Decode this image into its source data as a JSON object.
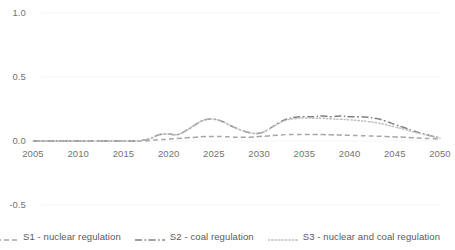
{
  "chart_data": {
    "type": "line",
    "title": "",
    "xlabel": "",
    "ylabel": "",
    "xlim": [
      2005,
      2050
    ],
    "ylim": [
      -0.5,
      1.0
    ],
    "ytick_labels": [
      "1.0",
      "0.5",
      "0.0",
      "-0.5"
    ],
    "ytick_values": [
      1.0,
      0.5,
      0.0,
      -0.5
    ],
    "xtick_labels": [
      "2005",
      "2010",
      "2015",
      "2020",
      "2025",
      "2030",
      "2035",
      "2040",
      "2045",
      "2050"
    ],
    "xtick_values": [
      2005,
      2010,
      2015,
      2020,
      2025,
      2030,
      2035,
      2040,
      2045,
      2050
    ],
    "grid": false,
    "legend_position": "bottom",
    "x": [
      2005,
      2006,
      2007,
      2008,
      2009,
      2010,
      2011,
      2012,
      2013,
      2014,
      2015,
      2016,
      2017,
      2018,
      2019,
      2020,
      2021,
      2022,
      2023,
      2024,
      2025,
      2026,
      2027,
      2028,
      2029,
      2030,
      2031,
      2032,
      2033,
      2034,
      2035,
      2036,
      2037,
      2038,
      2039,
      2040,
      2041,
      2042,
      2043,
      2044,
      2045,
      2046,
      2047,
      2048,
      2049,
      2050
    ],
    "series": [
      {
        "name": "S1 - nuclear regulation",
        "style": "dashed",
        "color": "#a6a6a6",
        "values": [
          0.0,
          0.0,
          0.0,
          0.0,
          0.0,
          0.0,
          0.0,
          0.0,
          0.0,
          0.0,
          0.0,
          0.0,
          0.0,
          0.005,
          0.01,
          0.015,
          0.02,
          0.025,
          0.03,
          0.035,
          0.035,
          0.035,
          0.03,
          0.03,
          0.03,
          0.035,
          0.04,
          0.045,
          0.05,
          0.05,
          0.05,
          0.05,
          0.05,
          0.048,
          0.046,
          0.044,
          0.042,
          0.04,
          0.038,
          0.035,
          0.032,
          0.03,
          0.026,
          0.022,
          0.018,
          0.015
        ]
      },
      {
        "name": "S2 - coal regulation",
        "style": "dash-dot",
        "color": "#808080",
        "values": [
          0.0,
          0.0,
          0.0,
          0.0,
          0.0,
          0.0,
          0.0,
          0.0,
          0.0,
          0.0,
          0.0,
          0.0,
          0.005,
          0.02,
          0.05,
          0.055,
          0.05,
          0.085,
          0.13,
          0.165,
          0.17,
          0.15,
          0.115,
          0.085,
          0.065,
          0.06,
          0.09,
          0.135,
          0.17,
          0.185,
          0.19,
          0.19,
          0.195,
          0.19,
          0.195,
          0.19,
          0.19,
          0.185,
          0.175,
          0.155,
          0.13,
          0.105,
          0.08,
          0.06,
          0.04,
          0.025
        ]
      },
      {
        "name": "S3 - nuclear and coal regulation",
        "style": "dotted",
        "color": "#bfbfbf",
        "values": [
          0.0,
          0.0,
          0.0,
          0.0,
          0.0,
          0.0,
          0.0,
          0.0,
          0.0,
          0.0,
          0.0,
          0.0,
          0.005,
          0.02,
          0.05,
          0.055,
          0.05,
          0.085,
          0.13,
          0.165,
          0.17,
          0.15,
          0.115,
          0.085,
          0.065,
          0.06,
          0.088,
          0.13,
          0.162,
          0.175,
          0.18,
          0.178,
          0.178,
          0.172,
          0.17,
          0.165,
          0.16,
          0.152,
          0.142,
          0.128,
          0.11,
          0.092,
          0.072,
          0.055,
          0.038,
          0.022
        ]
      }
    ]
  },
  "legend": {
    "items": [
      {
        "label": "S1 - nuclear regulation",
        "style": "dashed",
        "color": "#a6a6a6"
      },
      {
        "label": "S2 - coal regulation",
        "style": "dash-dot",
        "color": "#808080"
      },
      {
        "label": "S3 - nuclear and coal regulation",
        "style": "dotted",
        "color": "#bfbfbf"
      }
    ]
  }
}
